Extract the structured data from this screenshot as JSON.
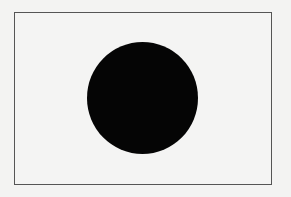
{
  "figure": {
    "shape": "circle",
    "fill_color": "#050505",
    "frame_border_color": "#555555",
    "background_color": "#f3f3f2"
  }
}
